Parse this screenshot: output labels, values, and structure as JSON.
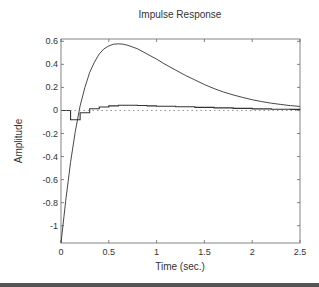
{
  "chart_data": {
    "type": "line",
    "title": "Impulse Response",
    "xlabel": "Time (sec.)",
    "ylabel": "Amplitude",
    "xlim": [
      0,
      2.5
    ],
    "ylim": [
      -1.15,
      0.62
    ],
    "xticks": [
      0,
      0.5,
      1,
      1.5,
      2,
      2.5
    ],
    "xtick_labels": [
      "0",
      "0.5",
      "1",
      "1.5",
      "2",
      "2.5"
    ],
    "yticks": [
      0.6,
      0.4,
      0.2,
      0,
      -0.2,
      -0.4,
      -0.6,
      -0.8,
      -1
    ],
    "ytick_labels": [
      "0.6",
      "0.4",
      "0.2",
      "0",
      "-0.2",
      "-0.4",
      "-0.6",
      "-0.8",
      "-1"
    ],
    "grid": false,
    "legend": null,
    "series": [
      {
        "name": "continuous",
        "style": "solid",
        "x": [
          0,
          0.05,
          0.1,
          0.15,
          0.2,
          0.25,
          0.3,
          0.35,
          0.4,
          0.45,
          0.5,
          0.55,
          0.6,
          0.65,
          0.7,
          0.8,
          0.9,
          1.0,
          1.1,
          1.2,
          1.3,
          1.4,
          1.5,
          1.6,
          1.7,
          1.8,
          1.9,
          2.0,
          2.1,
          2.2,
          2.3,
          2.4,
          2.5
        ],
        "y": [
          -1.15,
          -0.78,
          -0.45,
          -0.18,
          0.04,
          0.2,
          0.33,
          0.42,
          0.49,
          0.535,
          0.56,
          0.575,
          0.578,
          0.575,
          0.565,
          0.535,
          0.49,
          0.445,
          0.395,
          0.35,
          0.305,
          0.265,
          0.225,
          0.19,
          0.16,
          0.135,
          0.113,
          0.093,
          0.077,
          0.063,
          0.052,
          0.042,
          0.035
        ]
      },
      {
        "name": "discrete (zero-order hold)",
        "style": "stairs",
        "x": [
          0,
          0.1,
          0.2,
          0.3,
          0.4,
          0.5,
          0.6,
          0.7,
          0.8,
          0.9,
          1.0,
          1.2,
          1.4,
          1.6,
          1.8,
          2.0,
          2.2,
          2.4,
          2.5
        ],
        "y": [
          0,
          -0.08,
          -0.02,
          0.015,
          0.03,
          0.04,
          0.045,
          0.045,
          0.043,
          0.04,
          0.037,
          0.032,
          0.027,
          0.022,
          0.018,
          0.014,
          0.011,
          0.009,
          0.008
        ]
      },
      {
        "name": "zero reference",
        "style": "dotted",
        "x": [
          0,
          2.5
        ],
        "y": [
          0,
          0
        ]
      }
    ]
  }
}
